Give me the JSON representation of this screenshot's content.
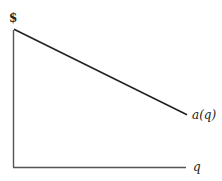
{
  "diagram": {
    "y_axis_label": "$",
    "x_axis_label": "q",
    "curve_label": "a(q)",
    "curve": {
      "type": "line",
      "description": "downward-sloping linear function",
      "start": {
        "q": 0,
        "value": 0.87
      },
      "end": {
        "q": 1.0,
        "value": 0.33
      }
    },
    "colors": {
      "axis": "#555555",
      "curve": "#222222",
      "text": "#222222"
    }
  }
}
